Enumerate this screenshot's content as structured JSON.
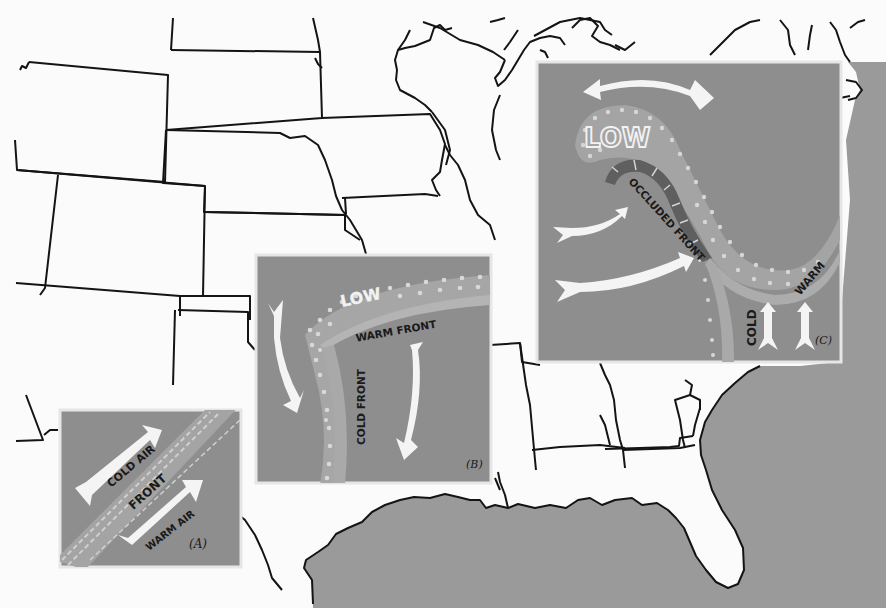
{
  "colors": {
    "paper": "#fbfbfb",
    "land_outline": "#141414",
    "water": "#9a9a9a",
    "panel_bg": "#8e8e8e",
    "panel_border": "#e6e6e6",
    "front_band": "#a9a9a9",
    "occluded_band": "#5f5f5f",
    "arrow": "#f4f4f4",
    "text_dark": "#1a1a1a",
    "text_light": "#f2f2f2"
  },
  "panels": {
    "a": {
      "id_label": "(A)",
      "cold_air": "COLD AIR",
      "front": "FRONT",
      "warm_air": "WARM AIR"
    },
    "b": {
      "id_label": "(B)",
      "low": "LOW",
      "warm_front": "WARM FRONT",
      "cold_front": "COLD FRONT"
    },
    "c": {
      "id_label": "(C)",
      "low": "LOW",
      "occluded_front": "OCCLUDED FRONT",
      "cold": "COLD",
      "warm": "WARM"
    }
  }
}
